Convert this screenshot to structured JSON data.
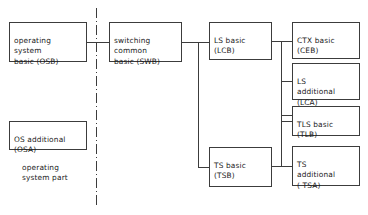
{
  "diagram": {
    "background_color": "#ffffff",
    "line_color": "#3c3c3c",
    "text_color": "#1a1a1a",
    "divider": {
      "name": "part-divider",
      "style": "dash-dot vertical",
      "x": 96,
      "y_top": 8,
      "y_bottom": 206
    },
    "caption": {
      "text": "operating\nsystem part",
      "x": 22,
      "y": 163
    },
    "nodes": [
      {
        "id": "osb",
        "label": "operating\nsystem\nbasic (OSB)",
        "x": 9,
        "y": 22,
        "w": 78,
        "h": 40
      },
      {
        "id": "osa",
        "label": "OS additional\n(OSA)",
        "x": 9,
        "y": 121,
        "w": 78,
        "h": 29
      },
      {
        "id": "swb",
        "label": "switching\ncommon\nbasic (SWB)",
        "x": 109,
        "y": 22,
        "w": 73,
        "h": 40
      },
      {
        "id": "lcb",
        "label": "LS basic\n(LCB)",
        "x": 209,
        "y": 22,
        "w": 63,
        "h": 38
      },
      {
        "id": "tsb",
        "label": "TS basic\n(TSB)",
        "x": 209,
        "y": 147,
        "w": 63,
        "h": 40
      },
      {
        "id": "ceb",
        "label": "CTX basic\n(CEB)",
        "x": 292,
        "y": 22,
        "w": 68,
        "h": 37
      },
      {
        "id": "lca",
        "label": "LS\nadditional\n(LCA)",
        "x": 292,
        "y": 63,
        "w": 68,
        "h": 37
      },
      {
        "id": "tlb",
        "label": "TLS basic\n(TLB)",
        "x": 292,
        "y": 106,
        "w": 68,
        "h": 30
      },
      {
        "id": "tsa",
        "label": "TS\nadditional\n( TSA)",
        "x": 292,
        "y": 146,
        "w": 68,
        "h": 40
      }
    ],
    "connections": [
      {
        "from": "osb",
        "to": "swb",
        "path": "M87,42 L109,42"
      },
      {
        "from": "swb",
        "to": "lcb",
        "path": "M182,42 L209,42"
      },
      {
        "from": "swb",
        "to": "tsb",
        "path": "M198,42 L198,167 L209,167"
      },
      {
        "from": "lcb",
        "to": "ceb",
        "path": "M272,41 L292,41"
      },
      {
        "from": "lcb",
        "to": "lca",
        "path": "M281,41 L281,81 L292,81"
      },
      {
        "from": "lcb",
        "to": "tlb-bus",
        "path": "M281,81 L281,121 L292,121"
      },
      {
        "from": "tsb",
        "to": "tsa",
        "path": "M272,166 L292,166"
      },
      {
        "from": "tsb",
        "to": "tlb",
        "path": "M281,166 L281,116 L292,116"
      }
    ]
  }
}
